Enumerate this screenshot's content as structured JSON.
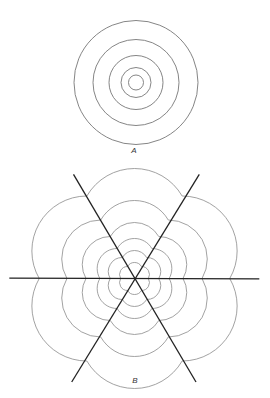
{
  "figure_a": {
    "label": "A",
    "label_pos": [
      134,
      150
    ],
    "center": [
      136,
      82.5
    ],
    "radii": [
      62,
      43,
      27,
      15,
      7.5
    ],
    "stroke": "#777777"
  },
  "figure_b": {
    "label": "B",
    "label_pos": [
      135,
      380
    ],
    "center": [
      134.5,
      278.5
    ],
    "lines": [
      {
        "from": [
          9.3,
          278.2
        ],
        "to": [
          259.3,
          278.8
        ]
      },
      {
        "from": [
          73.5,
          174.3
        ],
        "to": [
          196,
          382
        ]
      },
      {
        "from": [
          199.3,
          174.3
        ],
        "to": [
          71.7,
          382
        ]
      }
    ],
    "line_stroke": "#222222",
    "sector_bisectors_deg": [
      30,
      90,
      150,
      210,
      270,
      330
    ],
    "arc_distances": [
      8,
      14,
      20,
      28,
      39,
      55
    ],
    "arc_stroke": "#8a8a8a"
  }
}
